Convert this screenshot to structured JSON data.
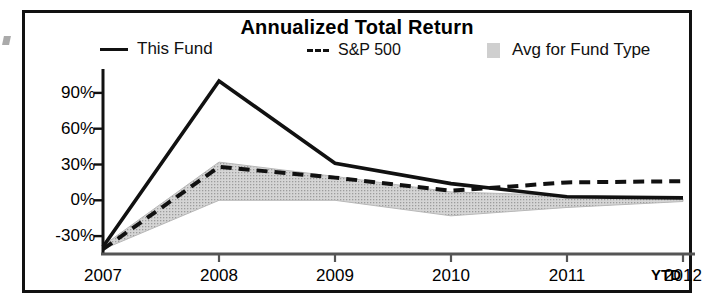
{
  "chart_title": "Annualized Total Return",
  "legend": {
    "position": "top",
    "items": [
      {
        "label": "This Fund",
        "marker": "solid-line-swatch",
        "color": "#111111"
      },
      {
        "label": "S&P 500",
        "marker": "dashed-line-swatch",
        "color": "#111111"
      },
      {
        "label": "Avg for Fund Type",
        "marker": "shaded-band-swatch",
        "color": "#cfcfcf"
      }
    ]
  },
  "axis": {
    "y_ticks": [
      "90%",
      "60%",
      "30%",
      "0%",
      "-30%"
    ],
    "x_ticks": [
      "2007",
      "2008",
      "2009",
      "2010",
      "2011",
      "2012"
    ],
    "x_suffix_label": "YTD"
  },
  "chart_data": {
    "type": "line",
    "title": "Annualized Total Return",
    "xlabel": "",
    "ylabel": "",
    "categories": [
      "2007",
      "2008",
      "2009",
      "2010",
      "2011",
      "2012"
    ],
    "x": [
      2007,
      2008,
      2009,
      2010,
      2011,
      2012
    ],
    "ylim": [
      -45,
      105
    ],
    "xlim": [
      2007,
      2012
    ],
    "yticks": [
      -30,
      0,
      30,
      60,
      90
    ],
    "ytick_labels": [
      "-30%",
      "0%",
      "30%",
      "60%",
      "90%"
    ],
    "grid": false,
    "legend_position": "top",
    "series": [
      {
        "name": "This Fund",
        "style": "solid",
        "color": "#111111",
        "values": [
          -39,
          100,
          31,
          14,
          3,
          2
        ]
      },
      {
        "name": "S&P 500",
        "style": "dashed",
        "color": "#111111",
        "values": [
          -41,
          28,
          19,
          8,
          15,
          16
        ]
      },
      {
        "name": "Avg for Fund Type",
        "style": "band",
        "color": "#cfcfcf",
        "band_upper": [
          -38,
          32,
          20,
          7,
          4,
          1
        ],
        "band_lower": [
          -41,
          0,
          0,
          -13,
          -6,
          -1
        ]
      }
    ]
  }
}
